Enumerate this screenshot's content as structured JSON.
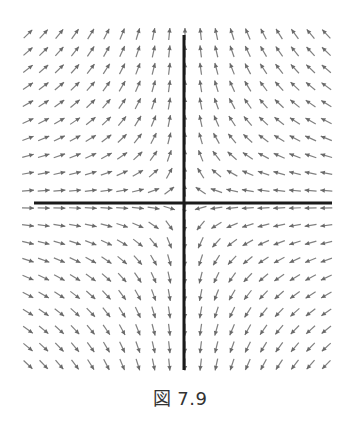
{
  "figure": {
    "caption": "図 7.9",
    "type": "direction field (saddle point)"
  },
  "axes": {
    "horizontal": {
      "x1": 34,
      "x2": 332,
      "y": 203,
      "color": "#1a1a1a",
      "width": 3
    },
    "vertical": {
      "x": 184,
      "y1": 35,
      "y2": 370,
      "color": "#1a1a1a",
      "width": 3
    }
  },
  "grid": {
    "cols": 20,
    "rows": 20,
    "x0": 28,
    "dx": 15.7,
    "y0": 34,
    "dy": 17.4,
    "arrow_length": 12,
    "arrow_color": "#808080",
    "head_color": "#6a6a6a"
  },
  "field": {
    "description": "dx/dt = -x, dy/dt = y; arrows normalized to equal length",
    "x_coef": -1,
    "y_coef": 1
  }
}
